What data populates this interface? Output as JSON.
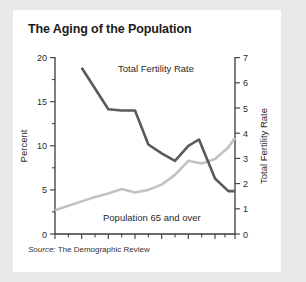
{
  "card": {
    "title": "The Aging of the Population",
    "source_keyword": "Source:",
    "source_text": " The Demographic Review"
  },
  "chart_data": {
    "type": "line",
    "title": "The Aging of the Population",
    "xlabel": "",
    "ylabel": "Percent",
    "y2label": "Total Fertility Rate",
    "ylim": [
      0,
      20
    ],
    "y2lim": [
      0,
      7
    ],
    "xlim": [
      1851,
      1986
    ],
    "grid": false,
    "legend": "inline-labels",
    "xticks": [
      1851,
      1871,
      1891,
      1911,
      1931,
      1951,
      1971,
      1986
    ],
    "xticks_minor": [
      1861,
      1881,
      1901,
      1921,
      1941,
      1961,
      1981
    ],
    "yticks": [
      0,
      5,
      10,
      15,
      20
    ],
    "yticks_minor": [
      2.5,
      7.5,
      12.5,
      17.5
    ],
    "y2ticks": [
      0,
      1,
      2,
      3,
      4,
      5,
      6,
      7
    ],
    "series": [
      {
        "name": "Total Fertility Rate",
        "axis": "right",
        "units": "children per woman",
        "color": "#5a5a5a",
        "x": [
          1871,
          1891,
          1901,
          1911,
          1921,
          1931,
          1941,
          1951,
          1959,
          1971,
          1981,
          1986
        ],
        "values": [
          6.6,
          4.95,
          4.9,
          4.9,
          3.55,
          3.2,
          2.9,
          3.5,
          3.75,
          2.2,
          1.7,
          1.7
        ]
      },
      {
        "name": "Population 65 and over",
        "axis": "left",
        "units": "percent",
        "color": "#c2c2c2",
        "x": [
          1851,
          1861,
          1871,
          1881,
          1891,
          1901,
          1911,
          1921,
          1931,
          1941,
          1951,
          1961,
          1971,
          1981,
          1986
        ],
        "values": [
          2.7,
          3.2,
          3.7,
          4.2,
          4.6,
          5.1,
          4.7,
          5.0,
          5.6,
          6.7,
          8.3,
          8.0,
          8.5,
          9.8,
          10.9
        ]
      }
    ],
    "annotations": [
      {
        "text": "Total Fertility Rate",
        "x": 1895,
        "y_percent": 17.2
      },
      {
        "text": "Population 65 and over",
        "x": 1925,
        "y_percent": 3.0
      }
    ]
  },
  "axes": {
    "left_title": "Percent",
    "right_title": "Total Fertility Rate",
    "left_ticks": [
      "20",
      "15",
      "10",
      "5",
      "0"
    ],
    "right_ticks": [
      "7",
      "6",
      "5",
      "4",
      "3",
      "2",
      "1",
      "0"
    ],
    "x_ticks": [
      "1851",
      "1871",
      "1891",
      "1911",
      "1931",
      "1951",
      "1971",
      "1986"
    ]
  }
}
